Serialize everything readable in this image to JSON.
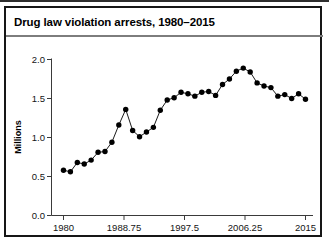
{
  "figure": {
    "title": "Drug law violation arrests, 1980–2015"
  },
  "chart_data": {
    "type": "line",
    "title": "Drug law violation arrests, 1980–2015",
    "xlabel": "",
    "ylabel": "Millions",
    "x": [
      1980,
      1981,
      1982,
      1983,
      1984,
      1985,
      1986,
      1987,
      1988,
      1989,
      1990,
      1991,
      1992,
      1993,
      1994,
      1995,
      1996,
      1997,
      1998,
      1999,
      2000,
      2001,
      2002,
      2003,
      2004,
      2005,
      2006,
      2007,
      2008,
      2009,
      2010,
      2011,
      2012,
      2013,
      2014,
      2015
    ],
    "series": [
      {
        "name": "Drug law violation arrests (millions)",
        "values": [
          0.58,
          0.56,
          0.68,
          0.66,
          0.71,
          0.81,
          0.82,
          0.94,
          1.16,
          1.36,
          1.09,
          1.01,
          1.07,
          1.13,
          1.35,
          1.48,
          1.51,
          1.58,
          1.56,
          1.53,
          1.58,
          1.59,
          1.54,
          1.68,
          1.75,
          1.85,
          1.89,
          1.84,
          1.7,
          1.66,
          1.64,
          1.53,
          1.55,
          1.5,
          1.56,
          1.49
        ]
      }
    ],
    "xlim": [
      1980,
      2015
    ],
    "ylim": [
      0.0,
      2.0
    ],
    "xtick_labels": [
      "1980",
      "1988.75",
      "1997.5",
      "2006.25",
      "2015"
    ],
    "ytick_labels": [
      "0.0",
      "0.5",
      "1.0",
      "1.5",
      "2.0"
    ],
    "grid": false,
    "legend": "none",
    "marker": "filled-circle",
    "colors": {
      "line": "#000000",
      "marker": "#000000",
      "axis": "#3a3a3a",
      "tick_text": "#141414",
      "frame_border": "#161616",
      "divider": "#7d7d7d",
      "background": "#ffffff"
    }
  }
}
